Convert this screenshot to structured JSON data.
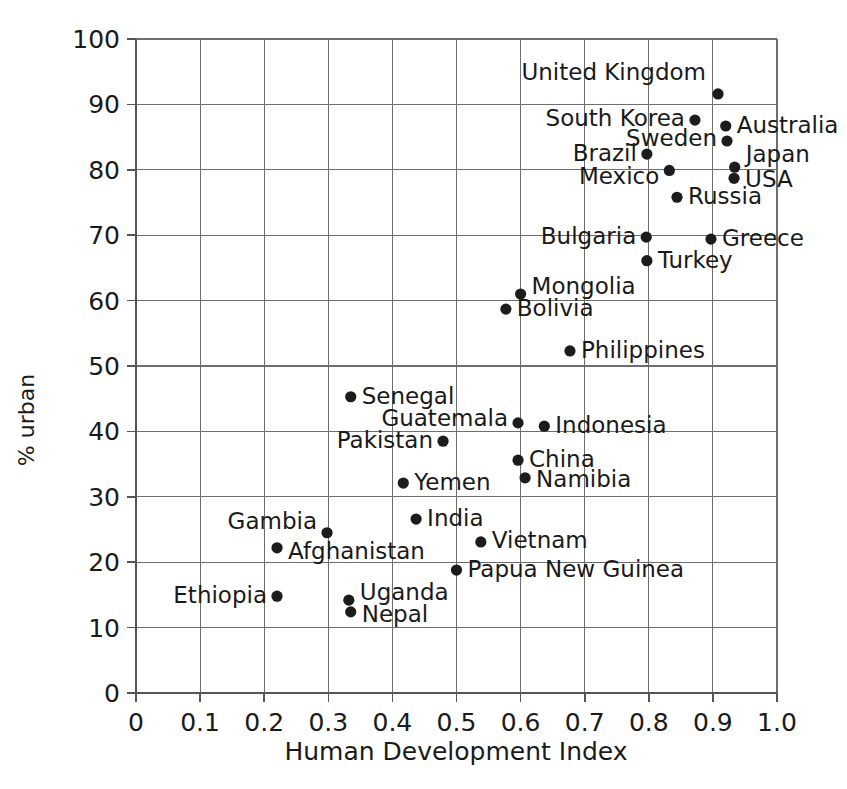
{
  "chart_data": {
    "type": "scatter",
    "title": "",
    "xlabel": "Human Development Index",
    "ylabel": "% urban",
    "xlim": [
      0,
      1.0
    ],
    "ylim": [
      0,
      100
    ],
    "grid": true,
    "legend": "none",
    "xticks": [
      "0",
      "0.1",
      "0.2",
      "0.3",
      "0.4",
      "0.5",
      "0.6",
      "0.7",
      "0.8",
      "0.9",
      "1.0"
    ],
    "xtick_values": [
      0,
      0.1,
      0.2,
      0.3,
      0.4,
      0.5,
      0.6,
      0.7,
      0.8,
      0.9,
      1.0
    ],
    "yticks": [
      "0",
      "10",
      "20",
      "30",
      "40",
      "50",
      "60",
      "70",
      "80",
      "90",
      "100"
    ],
    "ytick_values": [
      0,
      10,
      20,
      30,
      40,
      50,
      60,
      70,
      80,
      90,
      100
    ],
    "point_color": "#1c1c1c",
    "points": [
      {
        "label": "United Kingdom",
        "x": 0.908,
        "y": 91.6,
        "label_anchor": "end",
        "label_dx": -12,
        "label_dy": -14
      },
      {
        "label": "South Korea",
        "x": 0.872,
        "y": 87.6,
        "label_anchor": "end",
        "label_dx": -10,
        "label_dy": 6
      },
      {
        "label": "Australia",
        "x": 0.92,
        "y": 86.7,
        "label_anchor": "start",
        "label_dx": 11,
        "label_dy": 7
      },
      {
        "label": "Sweden",
        "x": 0.922,
        "y": 84.4,
        "label_anchor": "end",
        "label_dx": -10,
        "label_dy": 5
      },
      {
        "label": "Brazil",
        "x": 0.797,
        "y": 82.4,
        "label_anchor": "end",
        "label_dx": -10,
        "label_dy": 7
      },
      {
        "label": "Japan",
        "x": 0.934,
        "y": 80.4,
        "label_anchor": "start",
        "label_dx": 11,
        "label_dy": -5
      },
      {
        "label": "Mexico",
        "x": 0.832,
        "y": 79.9,
        "label_anchor": "end",
        "label_dx": -10,
        "label_dy": 14
      },
      {
        "label": "USA",
        "x": 0.933,
        "y": 78.7,
        "label_anchor": "start",
        "label_dx": 11,
        "label_dy": 9
      },
      {
        "label": "Russia",
        "x": 0.844,
        "y": 75.8,
        "label_anchor": "start",
        "label_dx": 11,
        "label_dy": 7
      },
      {
        "label": "Bulgaria",
        "x": 0.796,
        "y": 69.7,
        "label_anchor": "end",
        "label_dx": -10,
        "label_dy": 7
      },
      {
        "label": "Greece",
        "x": 0.897,
        "y": 69.4,
        "label_anchor": "start",
        "label_dx": 11,
        "label_dy": 7
      },
      {
        "label": "Turkey",
        "x": 0.797,
        "y": 66.1,
        "label_anchor": "start",
        "label_dx": 11,
        "label_dy": 7
      },
      {
        "label": "Mongolia",
        "x": 0.6,
        "y": 61.0,
        "label_anchor": "start",
        "label_dx": 11,
        "label_dy": 0
      },
      {
        "label": "Bolivia",
        "x": 0.577,
        "y": 58.7,
        "label_anchor": "start",
        "label_dx": 11,
        "label_dy": 7
      },
      {
        "label": "Philippines",
        "x": 0.677,
        "y": 52.3,
        "label_anchor": "start",
        "label_dx": 11,
        "label_dy": 7
      },
      {
        "label": "Senegal",
        "x": 0.335,
        "y": 45.3,
        "label_anchor": "start",
        "label_dx": 11,
        "label_dy": 7
      },
      {
        "label": "Guatemala",
        "x": 0.596,
        "y": 41.3,
        "label_anchor": "end",
        "label_dx": -10,
        "label_dy": 3
      },
      {
        "label": "Indonesia",
        "x": 0.637,
        "y": 40.8,
        "label_anchor": "start",
        "label_dx": 11,
        "label_dy": 7
      },
      {
        "label": "Pakistan",
        "x": 0.479,
        "y": 38.5,
        "label_anchor": "end",
        "label_dx": -10,
        "label_dy": 7
      },
      {
        "label": "China",
        "x": 0.596,
        "y": 35.6,
        "label_anchor": "start",
        "label_dx": 11,
        "label_dy": 7
      },
      {
        "label": "Namibia",
        "x": 0.607,
        "y": 32.9,
        "label_anchor": "start",
        "label_dx": 11,
        "label_dy": 9
      },
      {
        "label": "Yemen",
        "x": 0.417,
        "y": 32.1,
        "label_anchor": "start",
        "label_dx": 11,
        "label_dy": 7
      },
      {
        "label": "India",
        "x": 0.437,
        "y": 26.6,
        "label_anchor": "start",
        "label_dx": 11,
        "label_dy": 7
      },
      {
        "label": "Gambia",
        "x": 0.298,
        "y": 24.5,
        "label_anchor": "end",
        "label_dx": -10,
        "label_dy": -4
      },
      {
        "label": "Vietnam",
        "x": 0.538,
        "y": 23.1,
        "label_anchor": "start",
        "label_dx": 11,
        "label_dy": 6
      },
      {
        "label": "Afghanistan",
        "x": 0.22,
        "y": 22.2,
        "label_anchor": "start",
        "label_dx": 11,
        "label_dy": 11
      },
      {
        "label": "Papua New Guinea",
        "x": 0.5,
        "y": 18.8,
        "label_anchor": "start",
        "label_dx": 11,
        "label_dy": 7
      },
      {
        "label": "Ethiopia",
        "x": 0.22,
        "y": 14.8,
        "label_anchor": "end",
        "label_dx": -10,
        "label_dy": 7
      },
      {
        "label": "Uganda",
        "x": 0.332,
        "y": 14.2,
        "label_anchor": "start",
        "label_dx": 11,
        "label_dy": 0
      },
      {
        "label": "Nepal",
        "x": 0.335,
        "y": 12.4,
        "label_anchor": "start",
        "label_dx": 11,
        "label_dy": 10
      }
    ]
  },
  "caption": {
    "text": "…………… caption text clipped at page edge ……………"
  }
}
